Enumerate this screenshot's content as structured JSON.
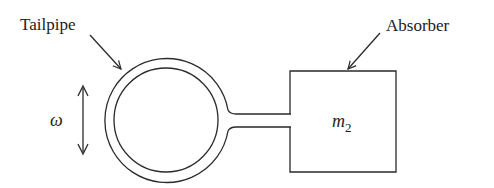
{
  "diagram": {
    "labels": {
      "tailpipe": "Tailpipe",
      "absorber": "Absorber",
      "frequency_symbol": "ω",
      "mass_symbol": "m",
      "mass_subscript": "2"
    },
    "colors": {
      "stroke": "#2a2a2a",
      "text": "#222222",
      "background": "#ffffff"
    }
  }
}
